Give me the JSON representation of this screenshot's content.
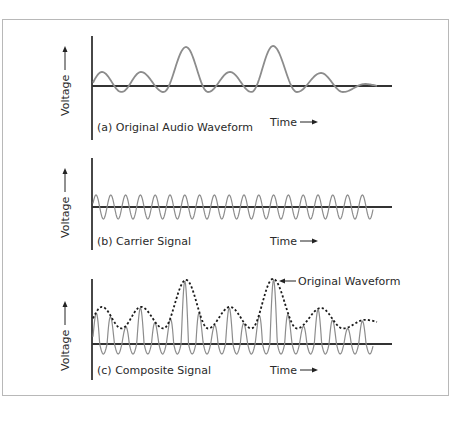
{
  "figure": {
    "panels": [
      {
        "id": "a",
        "caption": "(a) Original Audio Waveform",
        "ylabel": "Voltage",
        "xlabel": "Time",
        "baseline_y": 86,
        "axis_top": 36,
        "axis_bottom": 140,
        "caption_y": 131
      },
      {
        "id": "b",
        "caption": "(b) Carrier Signal",
        "ylabel": "Voltage",
        "xlabel": "Time",
        "baseline_y": 207,
        "axis_top": 158,
        "axis_bottom": 250,
        "caption_y": 245
      },
      {
        "id": "c",
        "caption": "(c) Composite Signal",
        "ylabel": "Voltage",
        "xlabel": "Time",
        "baseline_y": 344,
        "axis_top": 279,
        "axis_bottom": 380,
        "caption_y": 374
      }
    ],
    "annotation": {
      "label": "Original Waveform",
      "points_to_x": 278,
      "points_to_y": 283
    }
  },
  "chart_data": {
    "type": "line",
    "panels": [
      {
        "name": "(a) Original Audio Waveform",
        "xlabel": "Time",
        "ylabel": "Voltage",
        "series": [
          {
            "name": "Original audio waveform",
            "peaks_x": [
              102,
              141,
              186,
              230,
              273,
              321,
              365
            ],
            "peak_heights": [
              14,
              14,
              39,
              14,
              40,
              13,
              2
            ],
            "trough_depth": 6
          }
        ]
      },
      {
        "name": "(b) Carrier Signal",
        "xlabel": "Time",
        "ylabel": "Voltage",
        "series": [
          {
            "name": "Carrier",
            "cycles": 19,
            "amplitude": 12,
            "period_px": 14.8,
            "start_x": 93
          }
        ]
      },
      {
        "name": "(c) Composite Signal",
        "xlabel": "Time",
        "ylabel": "Voltage",
        "series": [
          {
            "name": "Composite (AM) signal",
            "cycles": 19
          },
          {
            "name": "Original Waveform",
            "style": "dashed envelope"
          }
        ]
      }
    ],
    "grid": false,
    "legend": "annotation arrow 'Original Waveform' in panel (c)"
  }
}
